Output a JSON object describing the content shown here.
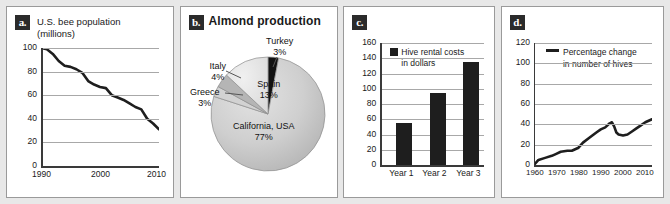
{
  "figure": {
    "background": "#e8e8e8",
    "panel_background": "#ffffff",
    "accent_dark": "#1e1e1e",
    "grid_color": "#a8a8a8"
  },
  "panels": [
    {
      "badge": "a.",
      "title": "U.S. bee population (millions)"
    },
    {
      "badge": "b.",
      "title": "Almond production"
    },
    {
      "badge": "c.",
      "title": ""
    },
    {
      "badge": "d.",
      "title": ""
    }
  ],
  "chart_data": [
    {
      "type": "line",
      "panel": "a",
      "title": "U.S. bee population (millions)",
      "title_line1": "U.S. bee population",
      "title_line2": "(millions)",
      "xlabel": "",
      "ylabel": "",
      "xlim": [
        1990,
        2010
      ],
      "ylim": [
        0,
        100
      ],
      "xticks": [
        1990,
        2000,
        2010
      ],
      "xtick_labels": [
        "1990",
        "2000",
        "2010"
      ],
      "yticks": [
        0,
        20,
        40,
        60,
        80,
        100
      ],
      "ytick_labels": [
        "0",
        "20",
        "40",
        "60",
        "80",
        "100"
      ],
      "grid": true,
      "legend": "none",
      "x": [
        1990,
        1991,
        1992,
        1993,
        1994,
        1995,
        1996,
        1997,
        1998,
        1999,
        2000,
        2001,
        2002,
        2003,
        2004,
        2005,
        2006,
        2007,
        2008,
        2009,
        2010
      ],
      "values": [
        100,
        99,
        95,
        89,
        85,
        84,
        82,
        79,
        72,
        69,
        67,
        66,
        60,
        58,
        56,
        53,
        50,
        48,
        40,
        36,
        31
      ]
    },
    {
      "type": "pie",
      "panel": "b",
      "title": "Almond production",
      "legend": "labels-on-slices",
      "labels": [
        "California, USA",
        "Spain",
        "Italy",
        "Greece",
        "Turkey"
      ],
      "values": [
        77,
        13,
        4,
        3,
        3
      ],
      "value_labels": [
        "77%",
        "13%",
        "4%",
        "3%",
        "3%"
      ],
      "slice_colors": [
        "#c9c9c9",
        "#e0e0e0",
        "#b5b5b5",
        "#d2d2d2",
        "#121212"
      ]
    },
    {
      "type": "bar",
      "panel": "c",
      "title": "",
      "legend_label_line1": "Hive rental costs",
      "legend_label_line2": "in dollars",
      "legend_label": "Hive rental costs in dollars",
      "categories": [
        "Year 1",
        "Year 2",
        "Year 3"
      ],
      "values": [
        55,
        95,
        135
      ],
      "xlabel": "",
      "ylabel": "",
      "ylim": [
        0,
        160
      ],
      "yticks": [
        0,
        20,
        40,
        60,
        80,
        100,
        120,
        140,
        160
      ],
      "ytick_labels": [
        "0",
        "20",
        "40",
        "60",
        "80",
        "100",
        "120",
        "140",
        "160"
      ],
      "grid": true,
      "bar_color": "#1e1e1e"
    },
    {
      "type": "line",
      "panel": "d",
      "title": "",
      "legend_label_line1": "Percentage change",
      "legend_label_line2": "in number of hives",
      "legend_label": "Percentage change in number of hives",
      "xlabel": "",
      "ylabel": "",
      "xlim": [
        1960,
        2013
      ],
      "ylim": [
        0,
        120
      ],
      "xticks": [
        1960,
        1970,
        1980,
        1990,
        2000,
        2010
      ],
      "xtick_labels": [
        "1960",
        "1970",
        "1980",
        "1990",
        "2000",
        "2010"
      ],
      "yticks": [
        0,
        20,
        40,
        60,
        80,
        100,
        120
      ],
      "ytick_labels": [
        "0",
        "20",
        "40",
        "60",
        "80",
        "100",
        "120"
      ],
      "grid": true,
      "x": [
        1960,
        1962,
        1965,
        1968,
        1970,
        1972,
        1975,
        1977,
        1980,
        1982,
        1985,
        1988,
        1990,
        1992,
        1994,
        1995,
        1996,
        1997,
        1998,
        2000,
        2002,
        2004,
        2006,
        2008,
        2010,
        2013
      ],
      "values": [
        0,
        5,
        7,
        9,
        11,
        13,
        14,
        14,
        17,
        22,
        27,
        32,
        35,
        37,
        41,
        42,
        38,
        32,
        30,
        29,
        30,
        33,
        36,
        39,
        42,
        45
      ]
    }
  ]
}
